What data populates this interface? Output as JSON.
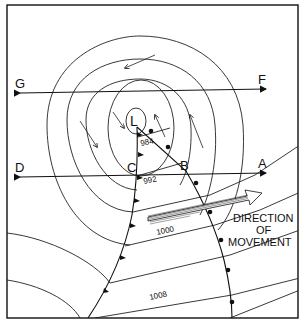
{
  "diagram": {
    "type": "weather-depression-map",
    "center_label": "L",
    "isobars": [
      {
        "value": "984",
        "label_pos": [
          157,
          143
        ]
      },
      {
        "value": "992",
        "label_pos": [
          152,
          181
        ]
      },
      {
        "value": "1000",
        "label_pos": [
          166,
          232
        ]
      },
      {
        "value": "1008",
        "label_pos": [
          157,
          298
        ]
      }
    ],
    "cross_sections": [
      {
        "left": "G",
        "right": "F"
      },
      {
        "left": "D",
        "right": "A"
      }
    ],
    "front_points": {
      "cold": "C",
      "warm": "B"
    },
    "annotation": {
      "line1": "DIRECTION",
      "line2": "OF",
      "line3": "MOVEMENT"
    },
    "colors": {
      "ink": "#111111",
      "background": "#ffffff"
    }
  }
}
